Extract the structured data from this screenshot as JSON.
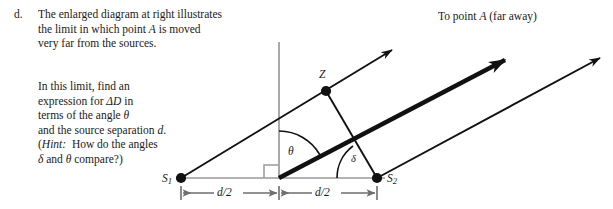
{
  "question": {
    "marker": "d.",
    "paragraph1": [
      "The enlarged diagram at right illustrates",
      "the limit in which point A is moved",
      "very far from the sources."
    ],
    "paragraph2_line1": "In this limit, find an",
    "paragraph2_line2_a": "expression for ",
    "paragraph2_line2_b": "ΔD",
    "paragraph2_line2_c": " in",
    "paragraph2_line3_a": "terms of the angle ",
    "paragraph2_line3_b": "θ",
    "paragraph2_line4_a": "and the source separation ",
    "paragraph2_line4_b": "d",
    "paragraph2_line4_c": ".",
    "paragraph2_line5_a": "(",
    "paragraph2_line5_b": "Hint:",
    "paragraph2_line5_c": "  How do the angles",
    "paragraph2_line6_a": "δ",
    "paragraph2_line6_b": " and ",
    "paragraph2_line6_c": "θ",
    "paragraph2_line6_d": " compare?)"
  },
  "diagram": {
    "top_caption": "To point A (far away)",
    "labels": {
      "source1": "S",
      "source1_sub": "1",
      "source2": "S",
      "source2_sub": "2",
      "point_z": "Z",
      "angle_theta": "θ",
      "angle_delta": "δ",
      "dim_left": "d/2",
      "dim_right": "d/2"
    },
    "colors": {
      "ink": "#111111",
      "axis_gray": "#9a9a9a",
      "dimension_gray": "#6e6e6e",
      "background": "#ffffff"
    },
    "geometry": {
      "source1_xy": [
        181,
        178
      ],
      "midpoint_xy": [
        279,
        178
      ],
      "source2_xy": [
        377,
        178
      ],
      "point_z_xy": [
        326,
        91
      ],
      "vertical_axis_top_y": 42,
      "baseline_y": 178,
      "dimension_line_y": 193,
      "thick_ray_tip_xy": [
        505,
        60
      ],
      "upper_ray_tip_xy": [
        392,
        50
      ],
      "lower_ray_tip_xy": [
        600,
        58
      ],
      "right_angle_box": [
        264,
        159,
        13,
        13
      ]
    }
  }
}
